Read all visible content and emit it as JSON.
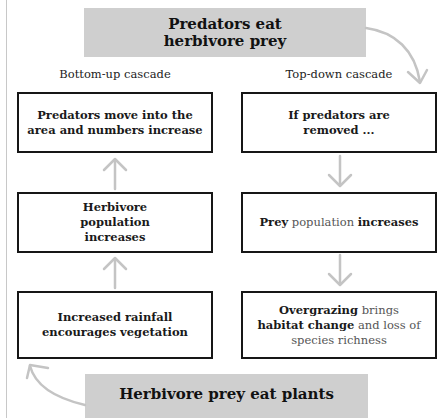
{
  "title_top": "Predators eat herbivore prey",
  "title_top_lines": [
    "Predators eat",
    "herbivore prey"
  ],
  "title_bottom": "Herbivore prey eat plants",
  "columns": {
    "left": {
      "label": "Bottom-up cascade",
      "direction": "up",
      "boxes": [
        {
          "text": "Predators move into the area and numbers increase"
        },
        {
          "text": "Herbivore population increases"
        },
        {
          "text": "Increased rainfall encourages vegetation"
        }
      ]
    },
    "right": {
      "label": "Top-down cascade",
      "direction": "down",
      "boxes": [
        {
          "text": "If predators are removed ..."
        },
        {
          "segments": [
            {
              "text": "Prey",
              "bold": true
            },
            {
              "text": " population ",
              "bold": false
            },
            {
              "text": "increases",
              "bold": true
            }
          ]
        },
        {
          "segments": [
            {
              "text": "Overgrazing",
              "bold": true
            },
            {
              "text": " brings ",
              "bold": false
            },
            {
              "text": "habitat change",
              "bold": true
            },
            {
              "text": " and loss of species richness",
              "bold": false
            }
          ]
        }
      ]
    }
  },
  "colors": {
    "banner": "#cfcfcf",
    "box_border": "#161616",
    "arrow": "#c4c4c4",
    "light_text": "#555555"
  }
}
